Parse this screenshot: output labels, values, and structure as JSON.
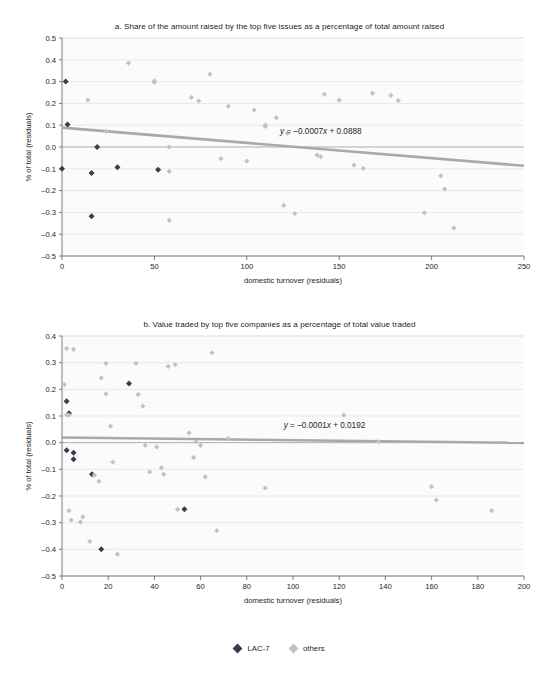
{
  "figure": {
    "legend": [
      {
        "label": "LAC-7",
        "color": "#3b3b4f",
        "key": "lac7"
      },
      {
        "label": "others",
        "color": "#bfc3c6",
        "key": "others"
      }
    ]
  },
  "chart_data": [
    {
      "id": "a",
      "type": "scatter",
      "title": "a. Share of the amount raised by the top five issues as a percentage of total amount raised",
      "xlabel": "domestic turnover (residuals)",
      "ylabel": "% of total (residuals)",
      "xlim": [
        0,
        250
      ],
      "ylim": [
        -0.5,
        0.5
      ],
      "xticks": [
        0,
        50,
        100,
        150,
        200,
        250
      ],
      "yticks": [
        0.5,
        0.4,
        0.3,
        0.2,
        0.1,
        0.0,
        -0.1,
        -0.2,
        -0.3,
        -0.4,
        -0.5
      ],
      "ytick_labels": [
        "0.5",
        "0.4",
        "0.3",
        "0.2",
        "0.1",
        "0.0",
        "-0.1",
        "-0.2",
        "-0.3",
        "-0.4",
        "-0.5"
      ],
      "xtick_labels": [
        "0",
        "50",
        "100",
        "150",
        "200",
        "250"
      ],
      "grid": true,
      "legend_position": "bottom",
      "trendline": {
        "equation": "y = -0.0007x + 0.0888",
        "slope": -0.0007,
        "intercept": 0.0888,
        "color": "#a9a9a9",
        "label_x": 118,
        "label_y": 0.058
      },
      "series": [
        {
          "name": "LAC-7",
          "color": "#3b3b4f",
          "points": [
            [
              2,
              0.3
            ],
            [
              3,
              0.103
            ],
            [
              16,
              -0.119
            ],
            [
              19,
              0.0
            ],
            [
              0,
              -0.1
            ],
            [
              16,
              -0.318
            ],
            [
              30,
              -0.093
            ],
            [
              52,
              -0.104
            ]
          ]
        },
        {
          "name": "others",
          "color": "#bfc3c6",
          "points": [
            [
              14,
              0.215
            ],
            [
              24,
              0.072
            ],
            [
              36,
              0.385
            ],
            [
              50,
              0.296
            ],
            [
              50,
              0.303
            ],
            [
              58,
              0.0
            ],
            [
              58,
              -0.112
            ],
            [
              58,
              -0.337
            ],
            [
              70,
              0.227
            ],
            [
              74,
              0.211
            ],
            [
              80,
              0.334
            ],
            [
              86,
              -0.053
            ],
            [
              90,
              0.187
            ],
            [
              100,
              -0.065
            ],
            [
              104,
              0.17
            ],
            [
              110,
              0.1
            ],
            [
              110,
              0.094
            ],
            [
              116,
              0.134
            ],
            [
              120,
              -0.268
            ],
            [
              122,
              0.062
            ],
            [
              126,
              -0.305
            ],
            [
              138,
              -0.037
            ],
            [
              140,
              -0.045
            ],
            [
              142,
              0.242
            ],
            [
              150,
              0.215
            ],
            [
              158,
              -0.083
            ],
            [
              163,
              -0.098
            ],
            [
              168,
              0.247
            ],
            [
              178,
              0.237
            ],
            [
              182,
              0.213
            ],
            [
              196,
              -0.302
            ],
            [
              205,
              -0.132
            ],
            [
              207,
              -0.193
            ],
            [
              212,
              -0.372
            ]
          ]
        }
      ]
    },
    {
      "id": "b",
      "type": "scatter",
      "title": "b. Value traded by top five companies as a percentage of total value traded",
      "xlabel": "domestic turnover (residuals)",
      "ylabel": "% of total (residuals)",
      "xlim": [
        0,
        200
      ],
      "ylim": [
        -0.5,
        0.4
      ],
      "xticks": [
        0,
        20,
        40,
        60,
        80,
        100,
        120,
        140,
        160,
        180,
        200
      ],
      "yticks": [
        0.4,
        0.3,
        0.2,
        0.1,
        0.0,
        -0.1,
        -0.2,
        -0.3,
        -0.4,
        -0.5
      ],
      "ytick_labels": [
        "0.4",
        "0.3",
        "0.2",
        "0.1",
        "0.0",
        "-0.1",
        "-0.2",
        "-0.3",
        "-0.4",
        "-0.5"
      ],
      "xtick_labels": [
        "0",
        "20",
        "40",
        "60",
        "80",
        "100",
        "120",
        "140",
        "160",
        "180",
        "200"
      ],
      "grid": true,
      "legend_position": "bottom",
      "trendline": {
        "equation": "y = -0.0001x + 0.0192",
        "slope": -0.0001,
        "intercept": 0.0192,
        "color": "#a9a9a9",
        "label_x": 96,
        "label_y": 0.055
      },
      "series": [
        {
          "name": "LAC-7",
          "color": "#3b3b4f",
          "points": [
            [
              2,
              0.155
            ],
            [
              3,
              0.11
            ],
            [
              2,
              -0.028
            ],
            [
              5,
              -0.038
            ],
            [
              5,
              -0.062
            ],
            [
              13,
              -0.118
            ],
            [
              17,
              -0.4
            ],
            [
              29,
              0.222
            ],
            [
              53,
              -0.25
            ]
          ]
        },
        {
          "name": "others",
          "color": "#bfc3c6",
          "points": [
            [
              2,
              0.353
            ],
            [
              5,
              0.35
            ],
            [
              1,
              0.218
            ],
            [
              2,
              0.105
            ],
            [
              3,
              0.103
            ],
            [
              3,
              -0.255
            ],
            [
              4,
              -0.29
            ],
            [
              8,
              -0.298
            ],
            [
              9,
              -0.278
            ],
            [
              12,
              -0.37
            ],
            [
              14,
              -0.122
            ],
            [
              16,
              -0.145
            ],
            [
              17,
              0.243
            ],
            [
              19,
              0.297
            ],
            [
              19,
              0.183
            ],
            [
              21,
              0.062
            ],
            [
              22,
              -0.073
            ],
            [
              24,
              -0.418
            ],
            [
              32,
              0.297
            ],
            [
              33,
              0.181
            ],
            [
              35,
              0.137
            ],
            [
              36,
              -0.01
            ],
            [
              38,
              -0.11
            ],
            [
              41,
              -0.016
            ],
            [
              43,
              -0.094
            ],
            [
              44,
              -0.118
            ],
            [
              46,
              0.286
            ],
            [
              49,
              0.293
            ],
            [
              50,
              -0.25
            ],
            [
              55,
              0.037
            ],
            [
              57,
              -0.055
            ],
            [
              58,
              0.004
            ],
            [
              60,
              -0.01
            ],
            [
              62,
              -0.128
            ],
            [
              65,
              0.337
            ],
            [
              67,
              -0.33
            ],
            [
              72,
              0.016
            ],
            [
              88,
              -0.17
            ],
            [
              122,
              0.103
            ],
            [
              137,
              0.004
            ],
            [
              160,
              -0.165
            ],
            [
              162,
              -0.215
            ],
            [
              186,
              -0.255
            ]
          ]
        }
      ]
    }
  ]
}
